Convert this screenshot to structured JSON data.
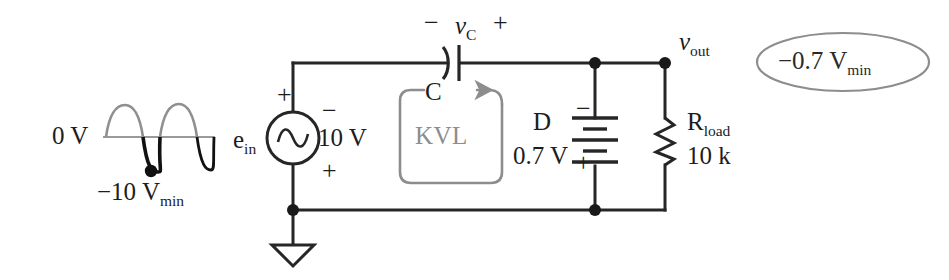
{
  "diagram": {
    "type": "circuit-schematic",
    "colors": {
      "wire": "#262626",
      "node": "#1a1a1a",
      "annotation_gray": "#8d8d8d",
      "axis_gray": "#9a9a9a",
      "waveform_black": "#111111",
      "background": "#ffffff"
    }
  },
  "waveform": {
    "zero_label": "0 V",
    "min_label_prefix": "−10 V",
    "min_label_sub": "min",
    "axis_value": 0,
    "amplitude_volts": 10,
    "cycles": 2
  },
  "source": {
    "name_prefix": "e",
    "name_sub": "in",
    "symbol": "ac-source",
    "top_polarity": "+",
    "bottom_polarity": "−",
    "value_label": "10 V",
    "value_top_sign": "−",
    "value_bottom_sign": "+"
  },
  "capacitor": {
    "label": "C",
    "voltage_label_prefix": "v",
    "voltage_label_sub": "C",
    "left_sign": "−",
    "right_sign": "+"
  },
  "kvl": {
    "label": "KVL",
    "loop_break_label": "C",
    "direction": "counterclockwise"
  },
  "diode": {
    "label": "D",
    "value_label": "0.7 V",
    "top_sign": "−",
    "bottom_sign": "+",
    "symbol": "battery-equivalent"
  },
  "load": {
    "name_prefix": "R",
    "name_sub": "load",
    "value_label": "10 k",
    "symbol": "resistor-zigzag"
  },
  "output": {
    "node_label_prefix": "v",
    "node_label_sub": "out",
    "callout_prefix": "−0.7 V",
    "callout_sub": "min"
  },
  "ground": {
    "symbol": "earth-triangle"
  }
}
